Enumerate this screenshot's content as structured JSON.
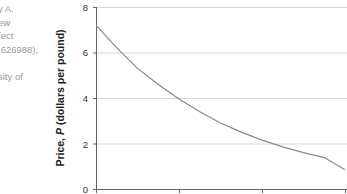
{
  "caption": {
    "lines": [
      "y A.",
      "ew",
      "fect",
      ".626988),",
      ",",
      "sity of"
    ]
  },
  "chart_data": {
    "type": "line",
    "title": "",
    "xlabel": "",
    "ylabel": "Price, P (dollars per pound)",
    "ylabel_parts": {
      "prefix": "Price, ",
      "var": "P",
      "suffix": " (dollars per pound)"
    },
    "yticks": [
      "8",
      "6",
      "4",
      "2",
      "0"
    ],
    "ylim": [
      0,
      8
    ],
    "xticks_count": 4,
    "xlim": [
      0,
      3
    ],
    "grid": "horizontal",
    "series": [
      {
        "name": "Price curve",
        "color": "#8a8a8a",
        "x": [
          0,
          0.25,
          0.5,
          0.75,
          1.0,
          1.25,
          1.5,
          1.75,
          2.0,
          2.25,
          2.5,
          2.75,
          3.0
        ],
        "values": [
          7.2,
          6.2,
          5.3,
          4.6,
          3.95,
          3.4,
          2.9,
          2.5,
          2.15,
          1.85,
          1.6,
          1.38,
          0.85
        ]
      }
    ]
  }
}
